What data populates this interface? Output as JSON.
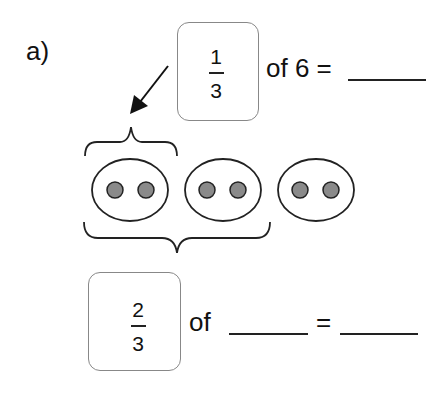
{
  "problem": {
    "label": "a)",
    "question1": {
      "fraction": {
        "numerator": "1",
        "denominator": "3"
      },
      "text": "of 6 =",
      "answer_blank": ""
    },
    "diagram": {
      "groups": 3,
      "dots_per_group": 2,
      "dot_color": "#8a8a8a",
      "small_brace_spans_groups": 1,
      "large_brace_spans_groups": 2
    },
    "question2": {
      "fraction": {
        "numerator": "2",
        "denominator": "3"
      },
      "text_of": "of",
      "equals": "=",
      "blank1": "",
      "blank2": ""
    }
  }
}
